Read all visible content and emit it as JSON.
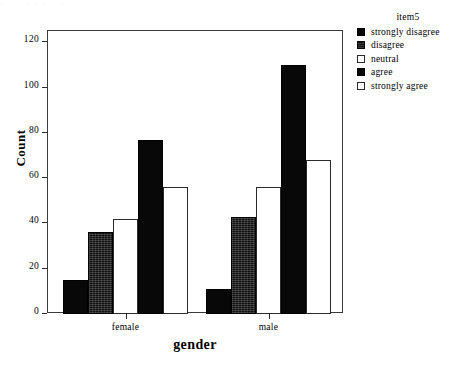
{
  "artifact": {
    "text": "·  ·   ·      ·        ·     · ·          ·"
  },
  "chart_data": {
    "type": "bar",
    "title": "",
    "xlabel": "gender",
    "ylabel": "Count",
    "categories": [
      "female",
      "male"
    ],
    "legend_title": "item5",
    "legend_position": "right",
    "grid": false,
    "ylim": [
      0,
      125
    ],
    "yticks": [
      0,
      20,
      40,
      60,
      80,
      100,
      120
    ],
    "ytick_labels": [
      "0",
      "20",
      "40",
      "60",
      "80",
      "100",
      "120"
    ],
    "series": [
      {
        "name": "strongly disagree",
        "fill": "solid",
        "values": [
          15,
          11
        ]
      },
      {
        "name": "disagree",
        "fill": "dither",
        "values": [
          36,
          43
        ]
      },
      {
        "name": "neutral",
        "fill": "open",
        "values": [
          42,
          56
        ]
      },
      {
        "name": "agree",
        "fill": "solid",
        "values": [
          77,
          110
        ]
      },
      {
        "name": "strongly agree",
        "fill": "open",
        "values": [
          56,
          68
        ]
      }
    ]
  }
}
